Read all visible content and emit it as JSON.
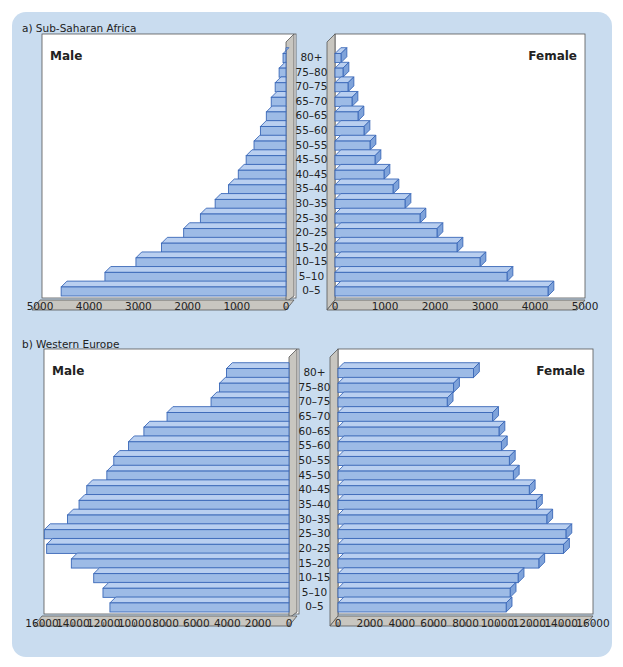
{
  "colors": {
    "card_bg": "#c9dcef",
    "plot_bg": "#ffffff",
    "bar_fill": "#9dbbe6",
    "bar_top": "#b9cff0",
    "bar_side": "#7fa3da",
    "bar_stroke": "#3a68b8",
    "wall": "#c8c6c0",
    "wall_stroke": "#555555"
  },
  "age_groups": [
    "0–5",
    "5–10",
    "10–15",
    "15–20",
    "20–25",
    "25–30",
    "30–35",
    "35–40",
    "40–45",
    "45–50",
    "50–55",
    "55–60",
    "60–65",
    "65–70",
    "70–75",
    "75–80",
    "80+"
  ],
  "chart_data": [
    {
      "type": "bar",
      "title": "a) Sub-Saharan Africa",
      "subtype": "population pyramid",
      "categories": [
        "0–5",
        "5–10",
        "10–15",
        "15–20",
        "20–25",
        "25–30",
        "30–35",
        "35–40",
        "40–45",
        "45–50",
        "50–55",
        "55–60",
        "60–65",
        "65–70",
        "70–75",
        "75–80",
        "80+"
      ],
      "series": [
        {
          "name": "Male",
          "values": [
            4570,
            3680,
            3050,
            2530,
            2080,
            1740,
            1440,
            1170,
            970,
            810,
            650,
            520,
            400,
            300,
            220,
            140,
            60
          ]
        },
        {
          "name": "Female",
          "values": [
            4260,
            3440,
            2900,
            2440,
            2040,
            1700,
            1400,
            1160,
            980,
            800,
            700,
            580,
            460,
            340,
            260,
            160,
            120
          ]
        }
      ],
      "xlim": [
        0,
        5000
      ],
      "xticks": [
        "0",
        "1000",
        "2000",
        "3000",
        "4000",
        "5000"
      ],
      "xticks_male": [
        "5000",
        "4000",
        "3000",
        "2000",
        "1000",
        "0"
      ],
      "xlabel": "",
      "ylabel": "Age group"
    },
    {
      "type": "bar",
      "title": "b) Western Europe",
      "subtype": "population pyramid",
      "categories": [
        "0–5",
        "5–10",
        "10–15",
        "15–20",
        "20–25",
        "25–30",
        "30–35",
        "35–40",
        "40–45",
        "45–50",
        "50–55",
        "55–60",
        "60–65",
        "65–70",
        "70–75",
        "75–80",
        "80+"
      ],
      "series": [
        {
          "name": "Male",
          "values": [
            11600,
            12050,
            12650,
            14100,
            15700,
            15850,
            14350,
            13600,
            13100,
            11800,
            11350,
            10400,
            9400,
            7900,
            5050,
            4500,
            4050
          ]
        },
        {
          "name": "Female",
          "values": [
            10550,
            10800,
            11300,
            12600,
            14150,
            14300,
            13100,
            12450,
            12000,
            11000,
            10750,
            10250,
            10100,
            9700,
            6850,
            7250,
            8500
          ]
        }
      ],
      "xlim": [
        0,
        16000
      ],
      "xticks": [
        "0",
        "2000",
        "4000",
        "6000",
        "8000",
        "10000",
        "12000",
        "14000",
        "16000"
      ],
      "xticks_male": [
        "16000",
        "14000",
        "12000",
        "10000",
        "8000",
        "6000",
        "4000",
        "2000",
        "0"
      ],
      "xlabel": "",
      "ylabel": "Age group"
    }
  ],
  "panels": [
    {
      "title": "a) Sub-Saharan Africa",
      "male_label": "Male",
      "female_label": "Female"
    },
    {
      "title": "b) Western Europe",
      "male_label": "Male",
      "female_label": "Female"
    }
  ]
}
